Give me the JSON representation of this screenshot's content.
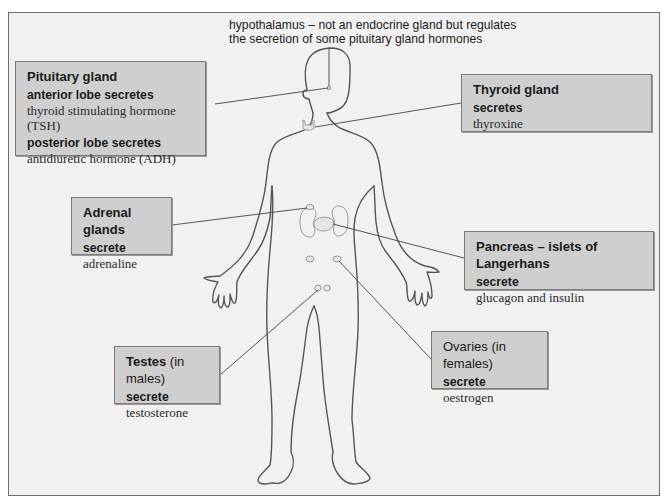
{
  "diagram": {
    "type": "human endocrine system labelled diagram",
    "caption": {
      "line1": "hypothalamus – not an endocrine gland but regulates",
      "line2": "the secretion of some pituitary gland hormones"
    },
    "glands": {
      "pituitary": {
        "title": "Pituitary gland",
        "sub1": "anterior lobe secretes",
        "hormone1": "thyroid stimulating hormone (TSH)",
        "sub2": "posterior lobe secretes",
        "hormone2": "antidiuretic hormone (ADH)"
      },
      "thyroid": {
        "title": "Thyroid gland",
        "sub": "secretes",
        "hormone": "thyroxine"
      },
      "adrenal": {
        "title": "Adrenal glands",
        "sub": "secrete",
        "hormone": "adrenaline"
      },
      "pancreas": {
        "title": "Pancreas – islets of Langerhans",
        "sub": "secrete",
        "hormone": "glucagon and insulin"
      },
      "testes": {
        "title": "Testes",
        "title_note": "(in males)",
        "sub": "secrete",
        "hormone": "testosterone"
      },
      "ovaries": {
        "title": "Ovaries",
        "title_note": "(in females)",
        "sub": "secrete",
        "hormone": "oestrogen"
      }
    },
    "colors": {
      "frame_bg": "#f1f1f1",
      "box_bg": "#cfcfcf",
      "outline": "#555555",
      "leader_line": "#444444",
      "organ": "#9a9a9a"
    }
  }
}
